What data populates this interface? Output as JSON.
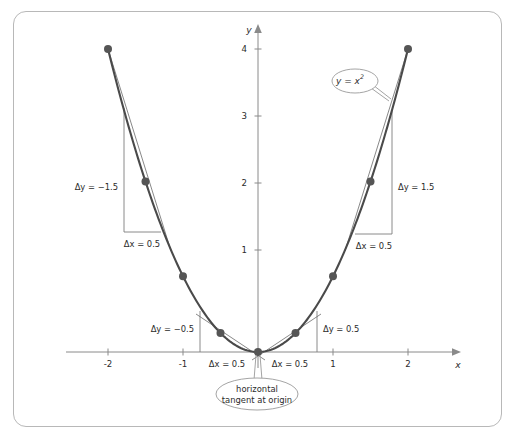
{
  "figure": {
    "border_color": "#b8b8b8",
    "background": "#ffffff",
    "curve_color": "#4a4a4a",
    "axis_color": "#8a8a8a",
    "point_color": "#555555"
  },
  "axes": {
    "x_label": "x",
    "y_label": "y",
    "x_ticks": [
      "-2",
      "-1",
      "1",
      "2"
    ],
    "y_ticks": [
      "1",
      "2",
      "3",
      "4"
    ],
    "x_range": [
      -2.45,
      2.45
    ],
    "y_range": [
      -0.35,
      4.45
    ]
  },
  "curve": {
    "equation_label": "y = x",
    "equation_exponent": "2",
    "function": "y = x^2"
  },
  "chart_data": {
    "type": "line",
    "xlabel": "x",
    "ylabel": "y",
    "xlim": [
      -2.45,
      2.45
    ],
    "ylim": [
      -0.35,
      4.45
    ],
    "grid": false,
    "legend": "none",
    "xticks": [
      -2,
      -1,
      1,
      2
    ],
    "yticks": [
      1,
      2,
      3,
      4
    ],
    "series": [
      {
        "name": "y = x^2",
        "x": [
          -2,
          -1.5,
          -1,
          -0.5,
          0,
          0.5,
          1,
          1.5,
          2
        ],
        "values": [
          4,
          2.25,
          1,
          0.25,
          0,
          0.25,
          1,
          2.25,
          4
        ]
      }
    ],
    "marked_points": [
      {
        "x": -2,
        "y": 4
      },
      {
        "x": -1.5,
        "y": 2.25
      },
      {
        "x": -1,
        "y": 1
      },
      {
        "x": -0.5,
        "y": 0.25
      },
      {
        "x": 0,
        "y": 0
      },
      {
        "x": 0.5,
        "y": 0.25
      },
      {
        "x": 1,
        "y": 1
      },
      {
        "x": 1.5,
        "y": 2.25
      },
      {
        "x": 2,
        "y": 4
      }
    ],
    "difference_quotient_triangles": [
      {
        "from_x": -2,
        "to_x": -1.5,
        "dx": 0.5,
        "dy": -1.75,
        "dx_label": "Δx = 0.5",
        "dy_label": "Δy = −1.5"
      },
      {
        "from_x": -0.5,
        "to_x": 0,
        "dx": 0.5,
        "dy": -0.25,
        "dx_label": "Δx = 0.5",
        "dy_label": "Δy = −0.5"
      },
      {
        "from_x": 0,
        "to_x": 0.5,
        "dx": 0.5,
        "dy": 0.25,
        "dx_label": "Δx = 0.5",
        "dy_label": "Δy = 0.5"
      },
      {
        "from_x": 1.5,
        "to_x": 2,
        "dx": 0.5,
        "dy": 1.75,
        "dx_label": "Δx = 0.5",
        "dy_label": "Δy = 1.5"
      }
    ],
    "annotations": [
      {
        "text": "y = x²",
        "kind": "callout-oval",
        "target": "curve-right-branch"
      },
      {
        "text": "horizontal tangent at origin",
        "kind": "callout-ellipse",
        "target": "origin"
      }
    ]
  },
  "labels": {
    "dy_left_outer": "Δy = −1.5",
    "dx_left_outer": "Δx = 0.5",
    "dy_left_inner": "Δy = −0.5",
    "dx_left_inner": "Δx = 0.5",
    "dy_right_inner": "Δy = 0.5",
    "dx_right_inner": "Δx = 0.5",
    "dy_right_outer": "Δy = 1.5",
    "dx_right_outer": "Δx = 0.5"
  },
  "callouts": {
    "equation": {
      "text_main": "y = x",
      "text_sup": "2"
    },
    "origin_note": {
      "line1": "horizontal",
      "line2": "tangent at origin"
    }
  }
}
